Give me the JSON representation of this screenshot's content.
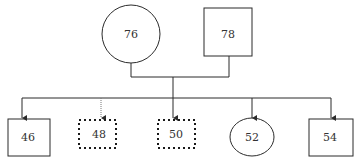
{
  "diagram": {
    "type": "family-tree / pedigree",
    "colors": {
      "stroke": "#2b2b2b",
      "dotted_stroke": "#1a1a1a",
      "background": "#ffffff",
      "text": "#333333"
    },
    "parents": [
      {
        "id": "76",
        "label": "76",
        "shape": "circle",
        "border": "solid"
      },
      {
        "id": "78",
        "label": "78",
        "shape": "square",
        "border": "solid"
      }
    ],
    "children": [
      {
        "id": "46",
        "label": "46",
        "shape": "square",
        "border": "solid",
        "arrow": "solid"
      },
      {
        "id": "48",
        "label": "48",
        "shape": "square",
        "border": "dotted",
        "arrow": "dotted"
      },
      {
        "id": "50",
        "label": "50",
        "shape": "square",
        "border": "dotted",
        "arrow": "solid"
      },
      {
        "id": "52",
        "label": "52",
        "shape": "circle",
        "border": "solid",
        "arrow": "solid"
      },
      {
        "id": "54",
        "label": "54",
        "shape": "square",
        "border": "solid",
        "arrow": "solid"
      }
    ]
  }
}
